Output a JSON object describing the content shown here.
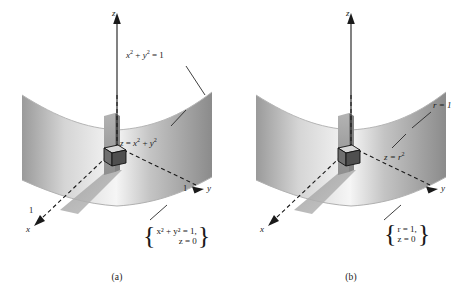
{
  "figure": {
    "background": "#ffffff",
    "ink": "#1a1a1a"
  },
  "panels": [
    {
      "id": "a",
      "caption": "(a)",
      "coordinate_system": "rectangular",
      "axes": [
        {
          "name": "z",
          "label": "z",
          "tick": null
        },
        {
          "name": "y",
          "label": "y",
          "tick": "1"
        },
        {
          "name": "x",
          "label": "x",
          "tick": "1"
        }
      ],
      "annotations": [
        {
          "name": "cylinder-equation",
          "text": "x² + y² = 1",
          "parts": [
            "x",
            "2",
            " + ",
            "y",
            "2",
            " = 1"
          ]
        },
        {
          "name": "paraboloid-equation",
          "text": "z = x² + y²"
        },
        {
          "name": "base-circle-set",
          "line1": "x² + y² = 1,",
          "line2": "z = 0"
        }
      ]
    },
    {
      "id": "b",
      "caption": "(b)",
      "coordinate_system": "cylindrical",
      "axes": [
        {
          "name": "z",
          "label": "z",
          "tick": null
        },
        {
          "name": "y",
          "label": "y",
          "tick": null
        },
        {
          "name": "x",
          "label": "x",
          "tick": null
        }
      ],
      "annotations": [
        {
          "name": "cylinder-equation",
          "text": "r = 1"
        },
        {
          "name": "paraboloid-equation",
          "text": "z = r²"
        },
        {
          "name": "base-circle-set",
          "line1": "r = 1,",
          "line2": "z = 0"
        }
      ]
    }
  ],
  "labels": {
    "axis_z": "z",
    "axis_y": "y",
    "axis_x": "x",
    "tick_one": "1",
    "a_cyl_var": "x",
    "a_cyl_var2": "y",
    "a_exp": "2",
    "b_cyl": "r = 1",
    "b_par": "z = r",
    "caption_a": "(a)",
    "caption_b": "(b)"
  },
  "colors": {
    "surface_light": "#f2f2f2",
    "surface_mid": "#c9c9c9",
    "surface_dark": "#8f8f8f",
    "slab": "#9b9b9b",
    "shadow": "#a5a5a5",
    "box_top": "#d8d8d8",
    "box_front": "#7d7d7d",
    "box_side": "#585858",
    "ink": "#1a1a1a"
  }
}
